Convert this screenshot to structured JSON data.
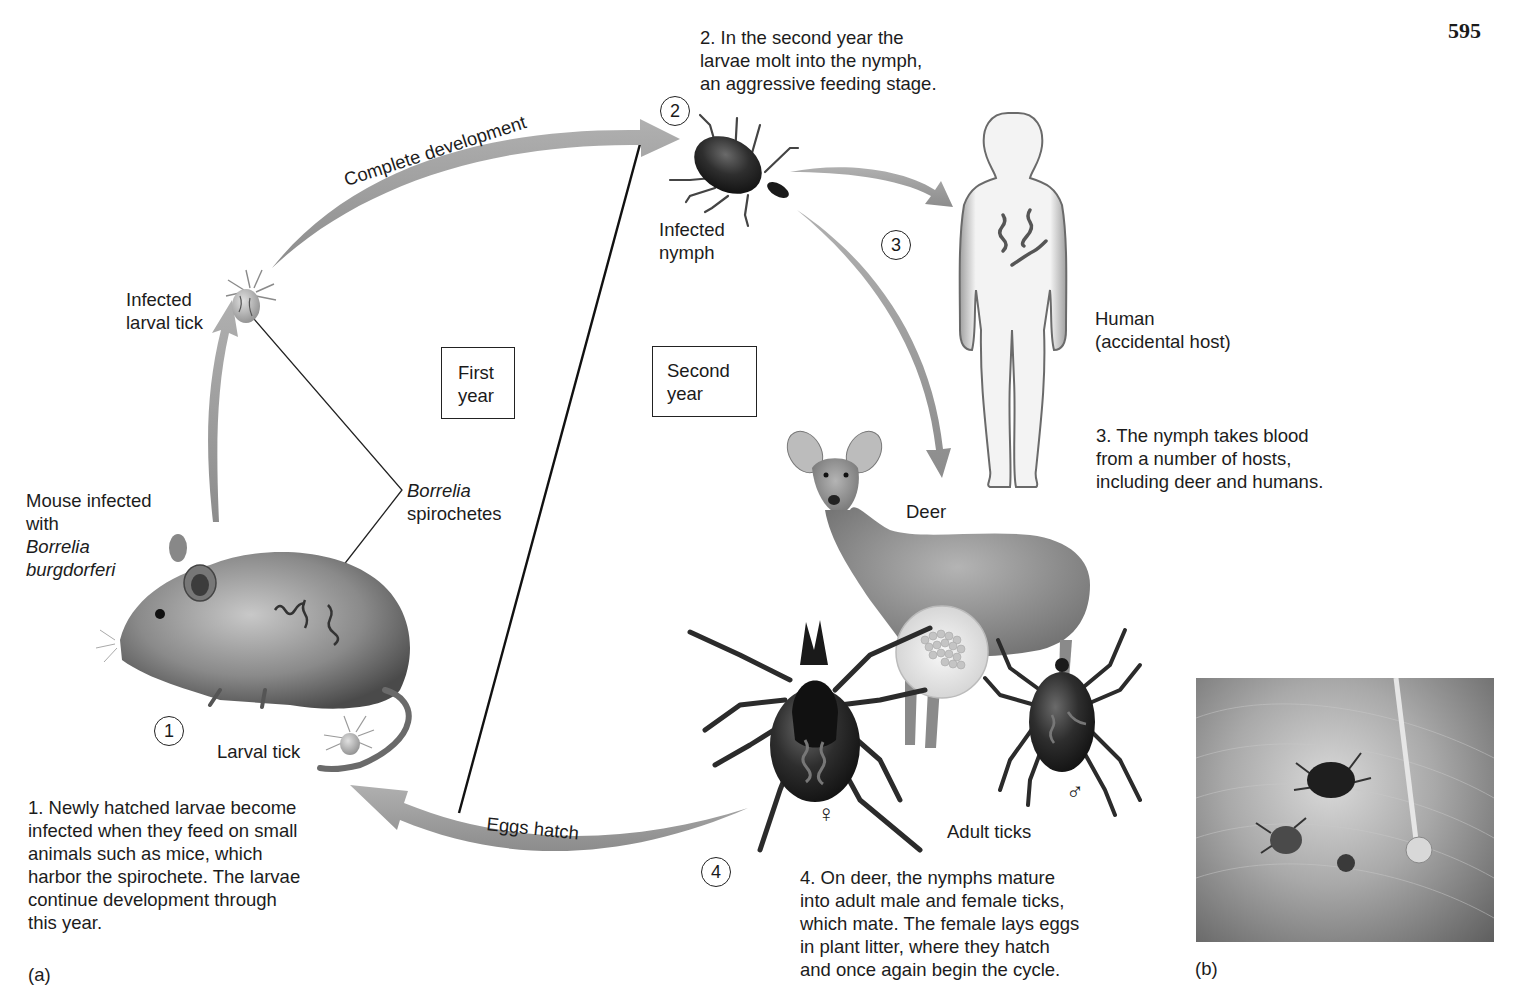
{
  "page": {
    "number": "595"
  },
  "figure": {
    "panel_a_label": "(a)",
    "panel_b_label": "(b)",
    "steps": [
      {
        "num": "1",
        "text_lines": [
          "1. Newly hatched larvae become",
          "infected when they feed on small",
          "animals such as mice, which",
          "harbor the spirochete. The larvae",
          "continue development through",
          "this year."
        ]
      },
      {
        "num": "2",
        "text_lines": [
          "2. In the second year the",
          "larvae molt into the nymph,",
          "an aggressive feeding stage."
        ]
      },
      {
        "num": "3",
        "text_lines": [
          "3. The nymph takes blood",
          "from a number of hosts,",
          "including deer and humans."
        ]
      },
      {
        "num": "4",
        "text_lines": [
          "4. On deer, the nymphs mature",
          "into adult male and female ticks,",
          "which mate. The female lays eggs",
          "in plant litter, where they hatch",
          "and once again begin the cycle."
        ]
      }
    ],
    "year_boxes": {
      "first": [
        "First",
        "year"
      ],
      "second": [
        "Second",
        "year"
      ]
    },
    "arrow_labels": {
      "complete_development": "Complete development",
      "eggs_hatch": "Eggs hatch"
    },
    "labels": {
      "infected_larval_tick": [
        "Infected",
        "larval tick"
      ],
      "mouse": [
        "Mouse infected",
        "with"
      ],
      "mouse_species": [
        "Borrelia",
        "burgdorferi"
      ],
      "borrelia_genus": "Borrelia",
      "borrelia_spirochetes": "spirochetes",
      "larval_tick": "Larval tick",
      "infected_nymph": [
        "Infected",
        "nymph"
      ],
      "human": [
        "Human",
        "(accidental host)"
      ],
      "deer": "Deer",
      "adult_ticks": "Adult ticks",
      "female_symbol": "♀",
      "male_symbol": "♂"
    },
    "colors": {
      "arrow": "#9a9a9a",
      "text": "#1c1c1c",
      "tick_body": "#2a2a2a"
    }
  }
}
